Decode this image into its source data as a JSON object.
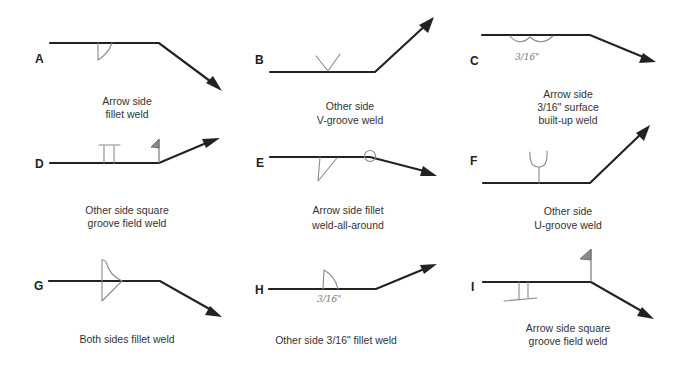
{
  "figure": {
    "panels": [
      {
        "id": "A",
        "letter": "A",
        "caption": [
          "Arrow side",
          "fillet weld"
        ],
        "symbol": "fillet",
        "side": "arrow",
        "dimension": ""
      },
      {
        "id": "B",
        "letter": "B",
        "caption": [
          "Other side",
          "V-groove weld"
        ],
        "symbol": "v-groove",
        "side": "other",
        "dimension": ""
      },
      {
        "id": "C",
        "letter": "C",
        "caption": [
          "Arrow side",
          "3/16\"  surface",
          "built-up weld"
        ],
        "symbol": "surfacing",
        "side": "arrow",
        "dimension": "3/16\""
      },
      {
        "id": "D",
        "letter": "D",
        "caption": [
          "Other side square",
          "groove field weld"
        ],
        "symbol": "square-groove",
        "side": "other",
        "field_weld": true,
        "dimension": ""
      },
      {
        "id": "E",
        "letter": "E",
        "caption": [
          "Arrow side fillet",
          "weld-all-around"
        ],
        "symbol": "fillet",
        "side": "arrow",
        "weld_all_around": true,
        "dimension": ""
      },
      {
        "id": "F",
        "letter": "F",
        "caption": [
          "Other side",
          "U-groove weld"
        ],
        "symbol": "u-groove",
        "side": "other",
        "dimension": ""
      },
      {
        "id": "G",
        "letter": "G",
        "caption": [
          "Both sides fillet weld"
        ],
        "symbol": "fillet",
        "side": "both",
        "dimension": ""
      },
      {
        "id": "H",
        "letter": "H",
        "caption": [
          "Other side 3/16\" fillet weld"
        ],
        "symbol": "fillet",
        "side": "other",
        "dimension": "3/16\""
      },
      {
        "id": "I",
        "letter": "I",
        "caption": [
          "Arrow side square",
          "groove field weld"
        ],
        "symbol": "square-groove",
        "side": "arrow",
        "field_weld": true,
        "dimension": ""
      }
    ]
  },
  "colors": {
    "line": "#222222",
    "symbol": "#8a8a8a",
    "text": "#333333",
    "background": "#ffffff"
  }
}
